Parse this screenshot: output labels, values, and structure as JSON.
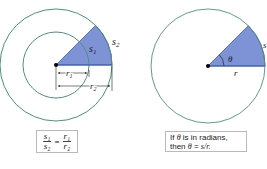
{
  "colors": {
    "circle_stroke": "#4f8f7f",
    "sector_fill": "#7d93d6",
    "sector_stroke": "#3c58b4",
    "box_border": "#b9b9b9"
  },
  "left_diagram": {
    "labels": {
      "s1": "s",
      "s1_sub": "1",
      "s2": "s",
      "s2_sub": "2",
      "r1": "r",
      "r1_sub": "1",
      "r2": "r",
      "r2_sub": "2"
    },
    "formula": {
      "num_left": "s₁",
      "den_left": "s₂",
      "equals": "=",
      "num_right": "r₁",
      "den_right": "r₂"
    }
  },
  "right_diagram": {
    "labels": {
      "theta": "θ",
      "s": "s",
      "r": "r"
    },
    "caption": {
      "line1_prefix": "If ",
      "line1_theta": "θ",
      "line1_suffix": " is in radians,",
      "line2_prefix": "then ",
      "line2_theta": "θ",
      "line2_eq": " = ",
      "line2_expr": "s/r."
    }
  }
}
